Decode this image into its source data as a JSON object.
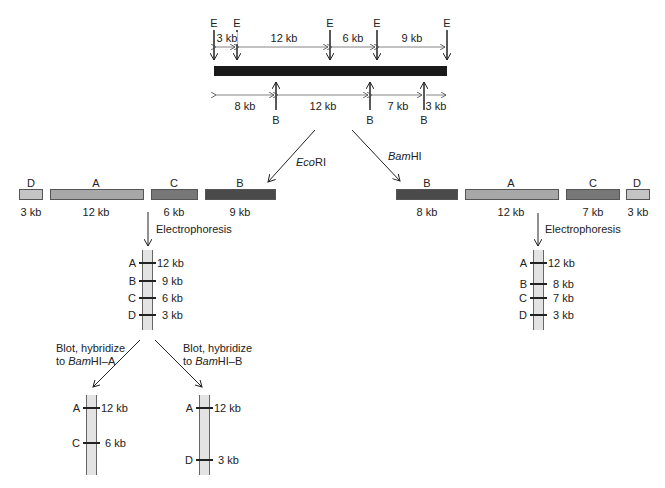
{
  "restriction_map": {
    "ecori_site_label": "E",
    "bamhi_site_label": "B",
    "ecori_segments": [
      "3 kb",
      "12 kb",
      "6 kb",
      "9 kb"
    ],
    "bamhi_segments": [
      "8 kb",
      "12 kb",
      "7 kb",
      "3 kb"
    ],
    "dna_color": "#1a1a1a"
  },
  "digests": {
    "ecori": {
      "enzyme_italic": "Eco",
      "enzyme_rest": "RI",
      "fragments": [
        {
          "name": "D",
          "size": "3 kb",
          "color": "#c4c4c4"
        },
        {
          "name": "A",
          "size": "12 kb",
          "color": "#a8a8a8"
        },
        {
          "name": "C",
          "size": "6 kb",
          "color": "#777777"
        },
        {
          "name": "B",
          "size": "9 kb",
          "color": "#4a4a4a"
        }
      ]
    },
    "bamhi": {
      "enzyme_italic": "Bam",
      "enzyme_rest": "HI",
      "fragments": [
        {
          "name": "B",
          "size": "8 kb",
          "color": "#4a4a4a"
        },
        {
          "name": "A",
          "size": "12 kb",
          "color": "#a8a8a8"
        },
        {
          "name": "C",
          "size": "7 kb",
          "color": "#777777"
        },
        {
          "name": "D",
          "size": "3 kb",
          "color": "#c4c4c4"
        }
      ]
    }
  },
  "electrophoresis_label": "Electrophoresis",
  "gels": {
    "ecori": [
      {
        "name": "A",
        "size": "12 kb"
      },
      {
        "name": "B",
        "size": "9 kb"
      },
      {
        "name": "C",
        "size": "6 kb"
      },
      {
        "name": "D",
        "size": "3 kb"
      }
    ],
    "bamhi": [
      {
        "name": "A",
        "size": "12 kb"
      },
      {
        "name": "B",
        "size": "8 kb"
      },
      {
        "name": "C",
        "size": "7 kb"
      },
      {
        "name": "D",
        "size": "3 kb"
      }
    ]
  },
  "blots": {
    "probe_a": {
      "line1": "Blot, hybridize",
      "line2_prefix": "to ",
      "line2_italic": "Bam",
      "line2_rest": "HI–A",
      "bands": [
        {
          "name": "A",
          "size": "12 kb"
        },
        {
          "name": "C",
          "size": "6 kb"
        }
      ]
    },
    "probe_b": {
      "line1": "Blot, hybridize",
      "line2_prefix": "to ",
      "line2_italic": "Bam",
      "line2_rest": "HI–B",
      "bands": [
        {
          "name": "A",
          "size": "12 kb"
        },
        {
          "name": "D",
          "size": "3 kb"
        }
      ]
    }
  }
}
